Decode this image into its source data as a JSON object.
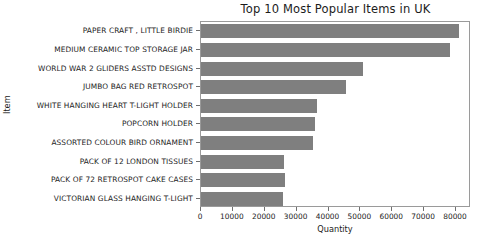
{
  "chart_data": {
    "type": "bar",
    "orientation": "horizontal",
    "title": "Top 10 Most Popular Items in UK",
    "xlabel": "Quantity",
    "ylabel": "Item",
    "xlim": [
      0,
      84700
    ],
    "xticks": [
      0,
      10000,
      20000,
      30000,
      40000,
      50000,
      60000,
      70000,
      80000
    ],
    "xtick_labels": [
      "0",
      "10000",
      "20000",
      "30000",
      "40000",
      "50000",
      "60000",
      "70000",
      "80000"
    ],
    "grid": false,
    "legend": null,
    "bar_color": "#7f7f7f",
    "categories": [
      "PAPER CRAFT , LITTLE BIRDIE",
      "MEDIUM CERAMIC TOP STORAGE JAR",
      "WORLD WAR 2 GLIDERS ASSTD DESIGNS",
      "JUMBO BAG RED RETROSPOT",
      "WHITE HANGING HEART T-LIGHT HOLDER",
      "POPCORN HOLDER",
      "ASSORTED COLOUR BIRD ORNAMENT",
      "PACK OF 12 LONDON TISSUES",
      "PACK OF 72 RETROSPOT CAKE CASES",
      "VICTORIAN GLASS HANGING T-LIGHT"
    ],
    "values": [
      81000,
      78000,
      50800,
      45500,
      36400,
      35700,
      35100,
      26000,
      26300,
      25700
    ]
  }
}
